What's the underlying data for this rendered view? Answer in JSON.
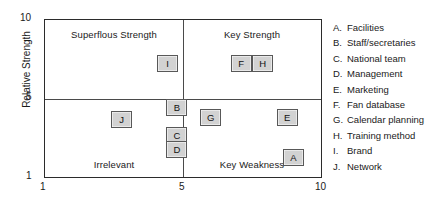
{
  "chart_data": {
    "type": "scatter",
    "title": "",
    "xlabel": "",
    "ylabel": "Relative Strength",
    "xlim": [
      1,
      10
    ],
    "ylim": [
      1,
      10
    ],
    "xticks": [
      "1",
      "5",
      "10"
    ],
    "yticks": [
      "1",
      "5",
      "10"
    ],
    "grid": false,
    "legend_position": "right",
    "quadrants": [
      {
        "id": "top-left",
        "label": "Superflous Strength"
      },
      {
        "id": "top-right",
        "label": "Key Strength"
      },
      {
        "id": "bottom-left",
        "label": "Irrelevant"
      },
      {
        "id": "bottom-right",
        "label": "Key Weakness"
      }
    ],
    "points": [
      {
        "key": "A",
        "name": "Facilities",
        "x": 9.1,
        "y": 2.1,
        "quadrant": "Key Weakness"
      },
      {
        "key": "B",
        "name": "Staff/secretaries",
        "x": 5.3,
        "y": 5.0,
        "quadrant": "Key Strength"
      },
      {
        "key": "C",
        "name": "National team",
        "x": 5.3,
        "y": 3.4,
        "quadrant": "Key Weakness"
      },
      {
        "key": "D",
        "name": "Management",
        "x": 5.3,
        "y": 2.6,
        "quadrant": "Key Weakness"
      },
      {
        "key": "E",
        "name": "Marketing",
        "x": 8.9,
        "y": 4.4,
        "quadrant": "Key Weakness"
      },
      {
        "key": "F",
        "name": "Fan database",
        "x": 7.4,
        "y": 7.5,
        "quadrant": "Key Strength"
      },
      {
        "key": "G",
        "name": "Calendar planning",
        "x": 6.4,
        "y": 4.4,
        "quadrant": "Key Weakness"
      },
      {
        "key": "H",
        "name": "Training method",
        "x": 8.1,
        "y": 7.5,
        "quadrant": "Key Strength"
      },
      {
        "key": "I",
        "name": "Brand",
        "x": 5.0,
        "y": 7.5,
        "quadrant": "Superflous Strength"
      },
      {
        "key": "J",
        "name": "Network",
        "x": 3.5,
        "y": 4.3,
        "quadrant": "Irrelevant"
      }
    ],
    "colors": {
      "marker_fill": "#d2d2d2",
      "marker_border": "#585858",
      "frame": "#2b2b2b",
      "divider": "#4a4a4a",
      "text": "#1a1a1a"
    }
  },
  "axes": {
    "y_title": "Relative Strength",
    "y_top": "10",
    "y_mid": "5",
    "y_bottom": "1",
    "x_left": "1",
    "x_mid": "5",
    "x_right": "10"
  },
  "quadrants": {
    "top_left": "Superflous Strength",
    "top_right": "Key Strength",
    "bottom_left": "Irrelevant",
    "bottom_right": "Key Weakness"
  },
  "markers": {
    "a": "A",
    "b": "B",
    "c": "C",
    "d": "D",
    "e": "E",
    "f": "F",
    "g": "G",
    "h": "H",
    "i": "I",
    "j": "J"
  },
  "legend": {
    "items": [
      {
        "key": "A.",
        "label": "Facilities"
      },
      {
        "key": "B.",
        "label": "Staff/secretaries"
      },
      {
        "key": "C.",
        "label": "National team"
      },
      {
        "key": "D.",
        "label": "Management"
      },
      {
        "key": "E.",
        "label": "Marketing"
      },
      {
        "key": "F.",
        "label": "Fan database"
      },
      {
        "key": "G.",
        "label": "Calendar planning"
      },
      {
        "key": "H.",
        "label": "Training method"
      },
      {
        "key": "I.",
        "label": "Brand"
      },
      {
        "key": "J.",
        "label": "Network"
      }
    ]
  }
}
